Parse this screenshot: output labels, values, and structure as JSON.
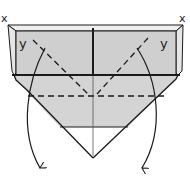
{
  "diagram": {
    "type": "origami-fold-step",
    "labels": {
      "corner_left": "x",
      "corner_right": "x",
      "flap_left": "y",
      "flap_right": "y"
    },
    "colors": {
      "paper_fill": "#d4d4d4",
      "flap_fill": "#cfcfcf",
      "edge_highlight": "#f2f2f2",
      "line": "#1a1a1a",
      "background": "#ffffff"
    },
    "lines": {
      "mountain_or_valley_dashed": [
        "horizontal-crease",
        "left-diagonal-crease",
        "right-diagonal-crease"
      ],
      "arrows": [
        "left-fold-arrow",
        "right-fold-arrow"
      ]
    }
  }
}
